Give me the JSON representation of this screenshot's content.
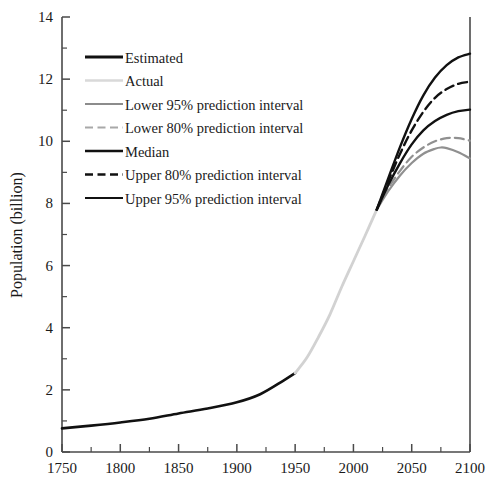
{
  "chart_data": {
    "type": "line",
    "title": "",
    "xlabel": "",
    "ylabel": "Population (billion)",
    "xlim": [
      1750,
      2100
    ],
    "ylim": [
      0,
      14
    ],
    "xticks": [
      1750,
      1800,
      1850,
      1900,
      1950,
      2000,
      2050,
      2100
    ],
    "yticks": [
      0,
      2,
      4,
      6,
      8,
      10,
      12,
      14
    ],
    "yminorticks": [
      1,
      3,
      5,
      7,
      9,
      11,
      13
    ],
    "grid": false,
    "legend_position": "upper left",
    "series": [
      {
        "name": "Estimated",
        "color": "#111111",
        "style": "solid",
        "width": 2.6,
        "x": [
          1750,
          1775,
          1800,
          1825,
          1850,
          1875,
          1900,
          1920,
          1940,
          1950
        ],
        "y": [
          0.76,
          0.85,
          0.95,
          1.07,
          1.24,
          1.4,
          1.6,
          1.86,
          2.3,
          2.54
        ]
      },
      {
        "name": "Actual",
        "color": "#d2d2d2",
        "style": "solid",
        "width": 2.8,
        "x": [
          1950,
          1960,
          1970,
          1980,
          1990,
          2000,
          2010,
          2020
        ],
        "y": [
          2.54,
          3.03,
          3.7,
          4.44,
          5.32,
          6.14,
          6.96,
          7.8
        ]
      },
      {
        "name": "Lower 95% prediction interval",
        "color": "#909090",
        "style": "solid",
        "width": 2.2,
        "x": [
          2020,
          2030,
          2040,
          2050,
          2060,
          2070,
          2075,
          2080,
          2090,
          2100
        ],
        "y": [
          7.8,
          8.4,
          8.9,
          9.3,
          9.6,
          9.76,
          9.8,
          9.78,
          9.65,
          9.45
        ]
      },
      {
        "name": "Lower 80% prediction interval",
        "color": "#909090",
        "style": "dashed",
        "width": 2.2,
        "x": [
          2020,
          2030,
          2040,
          2050,
          2060,
          2070,
          2080,
          2090,
          2100
        ],
        "y": [
          7.8,
          8.5,
          9.05,
          9.5,
          9.8,
          10.0,
          10.1,
          10.1,
          10.02
        ]
      },
      {
        "name": "Median",
        "color": "#111111",
        "style": "solid",
        "width": 2.4,
        "x": [
          2020,
          2030,
          2040,
          2050,
          2060,
          2070,
          2080,
          2090,
          2100
        ],
        "y": [
          7.8,
          8.6,
          9.3,
          9.9,
          10.35,
          10.65,
          10.85,
          10.97,
          11.02
        ]
      },
      {
        "name": "Upper 80% prediction interval",
        "color": "#111111",
        "style": "dashed",
        "width": 2.4,
        "x": [
          2020,
          2030,
          2040,
          2050,
          2060,
          2070,
          2080,
          2090,
          2100
        ],
        "y": [
          7.8,
          8.72,
          9.6,
          10.35,
          10.95,
          11.4,
          11.68,
          11.85,
          11.92
        ]
      },
      {
        "name": "Upper 95% prediction interval",
        "color": "#111111",
        "style": "solid",
        "width": 2.4,
        "x": [
          2020,
          2030,
          2040,
          2050,
          2060,
          2070,
          2080,
          2090,
          2100
        ],
        "y": [
          7.8,
          8.82,
          9.82,
          10.72,
          11.48,
          12.05,
          12.45,
          12.7,
          12.82
        ]
      }
    ],
    "legend": [
      {
        "label": "Estimated",
        "color": "#111111",
        "style": "solid",
        "width": 2.8
      },
      {
        "label": "Actual",
        "color": "#d9d9d9",
        "style": "solid",
        "width": 2.4
      },
      {
        "label": "Lower 95% prediction interval",
        "color": "#8c8c8c",
        "style": "solid",
        "width": 2.2
      },
      {
        "label": "Lower 80% prediction interval",
        "color": "#a8a8a8",
        "style": "dashed",
        "width": 2.2
      },
      {
        "label": "Median",
        "color": "#111111",
        "style": "solid",
        "width": 2.6
      },
      {
        "label": "Upper 80% prediction interval",
        "color": "#111111",
        "style": "dashed",
        "width": 2.6
      },
      {
        "label": "Upper 95% prediction interval",
        "color": "#111111",
        "style": "solid",
        "width": 2.2
      }
    ]
  }
}
